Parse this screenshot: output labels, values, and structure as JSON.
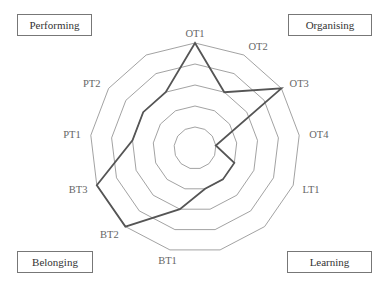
{
  "chart_data": {
    "type": "radar",
    "title": "",
    "axes": [
      "OT1",
      "OT2",
      "OT3",
      "OT4",
      "LT1",
      "",
      "",
      "BT1",
      "BT2",
      "BT3",
      "PT1",
      "PT2",
      ""
    ],
    "series": [
      {
        "name": "",
        "values": [
          5,
          3,
          5,
          1,
          2,
          2,
          2,
          3,
          5,
          5,
          3,
          3,
          3
        ]
      }
    ],
    "rlim": [
      0,
      5
    ],
    "rings": 5,
    "grid": true,
    "legend": "none",
    "quadrant_labels": {
      "top_left": "Performing",
      "top_right": "Organising",
      "bottom_left": "Belonging",
      "bottom_right": "Learning"
    }
  },
  "colors": {
    "grid": "#8a8a8a",
    "series": "#555555",
    "box_border": "#777777",
    "label": "#666666"
  },
  "layout": {
    "center": [
      195,
      148
    ],
    "radius": 105
  }
}
